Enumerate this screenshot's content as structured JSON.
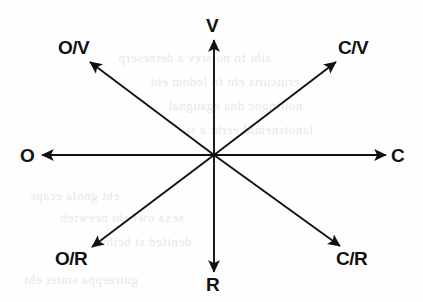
{
  "figure": {
    "type": "radial-axis-diagram",
    "center": {
      "x": 214,
      "y": 155
    },
    "background_color": "#fefefe",
    "line_color": "#111111"
  },
  "axes": [
    {
      "key": "v",
      "label": "V",
      "direction": "up",
      "angle_deg": 90,
      "label_x": 206,
      "label_y": 16,
      "tip_x": 214,
      "tip_y": 40
    },
    {
      "key": "cv",
      "label": "C/V",
      "direction": "up-right",
      "angle_deg": 37,
      "label_x": 338,
      "label_y": 38,
      "tip_x": 336,
      "tip_y": 62
    },
    {
      "key": "c",
      "label": "C",
      "direction": "right",
      "angle_deg": 0,
      "label_x": 391,
      "label_y": 146,
      "tip_x": 386,
      "tip_y": 155
    },
    {
      "key": "cr",
      "label": "C/R",
      "direction": "down-right",
      "angle_deg": -37,
      "label_x": 336,
      "label_y": 249,
      "tip_x": 340,
      "tip_y": 246
    },
    {
      "key": "r",
      "label": "R",
      "direction": "down",
      "angle_deg": -90,
      "label_x": 206,
      "label_y": 275,
      "tip_x": 214,
      "tip_y": 272
    },
    {
      "key": "or",
      "label": "O/R",
      "direction": "down-left",
      "angle_deg": 217,
      "label_x": 55,
      "label_y": 249,
      "tip_x": 92,
      "tip_y": 247
    },
    {
      "key": "o",
      "label": "O",
      "direction": "left",
      "angle_deg": 180,
      "label_x": 20,
      "label_y": 146,
      "tip_x": 42,
      "tip_y": 155
    },
    {
      "key": "ov",
      "label": "O/V",
      "direction": "up-left",
      "angle_deg": 143,
      "label_x": 58,
      "label_y": 38,
      "tip_x": 90,
      "tip_y": 62
    }
  ],
  "background_bleed": [
    {
      "text": "siht fo noisrev a detneserp",
      "x": 118,
      "y": 50
    },
    {
      "text": "erutcurts eht fo ledom eht",
      "x": 150,
      "y": 74
    },
    {
      "text": "noitingoc dna egaugnal",
      "x": 168,
      "y": 98
    },
    {
      "text": "lanoisnemid eerht a si",
      "x": 186,
      "y": 122
    },
    {
      "text": "eht gnola ecaps",
      "x": 30,
      "y": 188
    },
    {
      "text": "sexa owt eht neewteb",
      "x": 60,
      "y": 210
    },
    {
      "text": "denifed si hcihw",
      "x": 96,
      "y": 234
    },
    {
      "text": "gniraeppa smret eht",
      "x": 24,
      "y": 272
    }
  ]
}
